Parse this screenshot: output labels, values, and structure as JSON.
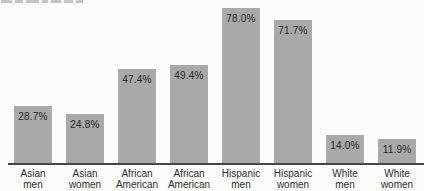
{
  "chart_data": {
    "type": "bar",
    "categories": [
      "Asian men",
      "Asian women",
      "African American",
      "African American",
      "Hispanic men",
      "Hispanic women",
      "White men",
      "White women"
    ],
    "category_lines": [
      [
        "Asian",
        "men"
      ],
      [
        "Asian",
        "women"
      ],
      [
        "African",
        "American"
      ],
      [
        "African",
        "American"
      ],
      [
        "Hispanic",
        "men"
      ],
      [
        "Hispanic",
        "women"
      ],
      [
        "White",
        "men"
      ],
      [
        "White",
        "women"
      ]
    ],
    "values": [
      28.7,
      24.8,
      47.4,
      49.4,
      78.0,
      71.7,
      14.0,
      11.9
    ],
    "value_labels": [
      "28.7%",
      "24.8%",
      "47.4%",
      "49.4%",
      "78.0%",
      "71.7%",
      "14.0%",
      "11.9%"
    ],
    "title": "",
    "xlabel": "",
    "ylabel": "",
    "ylim": [
      0,
      80
    ],
    "grid": false,
    "legend": false,
    "bar_color": "#a9a9a9",
    "value_label_color": "#262626",
    "category_label_color": "#2e2e2e",
    "axis_line_color": "#454545"
  }
}
